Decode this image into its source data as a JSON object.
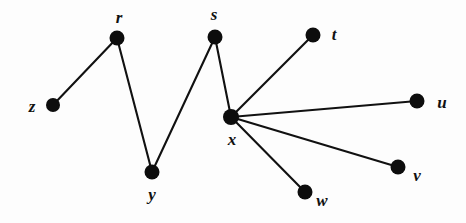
{
  "figure": {
    "background_color": "#fdfdfd",
    "node_color": "#0d0d0d",
    "edge_color": "#111111",
    "width": 466,
    "height": 223
  },
  "chart_data": {
    "type": "diagram",
    "diagram_kind": "undirected-graph",
    "title": "",
    "nodes": [
      {
        "id": "z",
        "label": "z",
        "x": 53,
        "y": 105,
        "r": 7,
        "label_x": 32,
        "label_y": 106
      },
      {
        "id": "r",
        "label": "r",
        "x": 117,
        "y": 38,
        "r": 7.5,
        "label_x": 119,
        "label_y": 17
      },
      {
        "id": "y",
        "label": "y",
        "x": 152,
        "y": 172,
        "r": 7.5,
        "label_x": 152,
        "label_y": 194
      },
      {
        "id": "s",
        "label": "s",
        "x": 215,
        "y": 37,
        "r": 7.5,
        "label_x": 214,
        "label_y": 14
      },
      {
        "id": "x",
        "label": "x",
        "x": 231,
        "y": 117,
        "r": 8,
        "label_x": 232,
        "label_y": 139
      },
      {
        "id": "t",
        "label": "t",
        "x": 313,
        "y": 35,
        "r": 7.5,
        "label_x": 334,
        "label_y": 34
      },
      {
        "id": "u",
        "label": "u",
        "x": 417,
        "y": 101,
        "r": 7.5,
        "label_x": 442,
        "label_y": 102
      },
      {
        "id": "v",
        "label": "v",
        "x": 398,
        "y": 167,
        "r": 7.5,
        "label_x": 417,
        "label_y": 175
      },
      {
        "id": "w",
        "label": "w",
        "x": 305,
        "y": 192,
        "r": 7.5,
        "label_x": 322,
        "label_y": 200
      }
    ],
    "edges": [
      {
        "from": "z",
        "to": "r"
      },
      {
        "from": "r",
        "to": "y"
      },
      {
        "from": "y",
        "to": "s"
      },
      {
        "from": "s",
        "to": "x"
      },
      {
        "from": "t",
        "to": "x"
      },
      {
        "from": "x",
        "to": "u"
      },
      {
        "from": "x",
        "to": "v"
      },
      {
        "from": "x",
        "to": "w"
      }
    ],
    "node_count": 9,
    "edge_count": 8,
    "xlim": [
      0,
      466
    ],
    "ylim": [
      0,
      223
    ],
    "grid": false,
    "legend": null,
    "xlabel": "",
    "ylabel": ""
  }
}
